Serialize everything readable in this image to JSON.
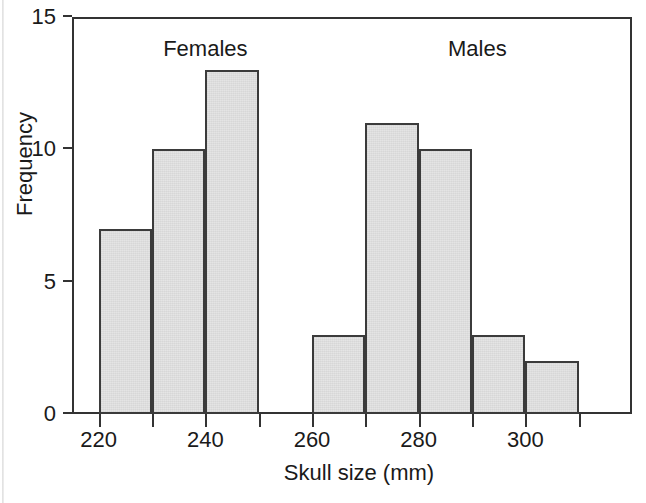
{
  "chart_data": {
    "type": "bar",
    "title": "",
    "subtitle": "",
    "xlabel": "Skull size (mm)",
    "ylabel": "Frequency",
    "xlim": [
      215,
      320
    ],
    "ylim": [
      0,
      15
    ],
    "grid": false,
    "legend_position": "none",
    "bin_width": 10,
    "x_ticks": [
      {
        "value": 220,
        "label": "220",
        "labeled": true
      },
      {
        "value": 230,
        "label": "",
        "labeled": false
      },
      {
        "value": 240,
        "label": "240",
        "labeled": true
      },
      {
        "value": 250,
        "label": "",
        "labeled": false
      },
      {
        "value": 260,
        "label": "260",
        "labeled": true
      },
      {
        "value": 270,
        "label": "",
        "labeled": false
      },
      {
        "value": 280,
        "label": "280",
        "labeled": true
      },
      {
        "value": 290,
        "label": "",
        "labeled": false
      },
      {
        "value": 300,
        "label": "300",
        "labeled": true
      },
      {
        "value": 310,
        "label": "",
        "labeled": false
      }
    ],
    "y_ticks": [
      {
        "value": 0,
        "label": "0"
      },
      {
        "value": 5,
        "label": "5"
      },
      {
        "value": 10,
        "label": "10"
      },
      {
        "value": 15,
        "label": "15"
      }
    ],
    "annotations": [
      {
        "text": "Females",
        "x": 240,
        "y": 14.2
      },
      {
        "text": "Males",
        "x": 291,
        "y": 14.2
      }
    ],
    "bins": [
      {
        "group": "Females",
        "x0": 220,
        "x1": 230,
        "value": 7
      },
      {
        "group": "Females",
        "x0": 230,
        "x1": 240,
        "value": 10
      },
      {
        "group": "Females",
        "x0": 240,
        "x1": 250,
        "value": 13
      },
      {
        "group": "Males",
        "x0": 260,
        "x1": 270,
        "value": 3
      },
      {
        "group": "Males",
        "x0": 270,
        "x1": 280,
        "value": 11
      },
      {
        "group": "Males",
        "x0": 280,
        "x1": 290,
        "value": 10
      },
      {
        "group": "Males",
        "x0": 290,
        "x1": 300,
        "value": 3
      },
      {
        "group": "Males",
        "x0": 300,
        "x1": 310,
        "value": 2
      }
    ],
    "categories": [
      "220-230",
      "230-240",
      "240-250",
      "260-270",
      "270-280",
      "280-290",
      "290-300",
      "300-310"
    ],
    "values": [
      7,
      10,
      13,
      3,
      11,
      10,
      3,
      2
    ],
    "colors": {
      "bar_fill": "#e3e3e3",
      "bar_stroke": "#3b3b3b",
      "axis": "#333333",
      "text": "#1a1a1a",
      "background": "#ffffff"
    }
  }
}
